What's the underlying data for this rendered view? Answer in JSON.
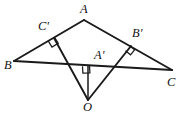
{
  "figure": {
    "type": "geometry-diagram",
    "width": 183,
    "height": 117,
    "background_color": "#ffffff",
    "stroke_color": "#1a1a1a",
    "labels": {
      "A": "A",
      "B": "B",
      "C": "C",
      "O": "O",
      "A_prime": "A'",
      "B_prime": "B'",
      "C_prime": "C'"
    },
    "points": [
      {
        "name": "A",
        "label": "A",
        "x": 84,
        "y": 20,
        "label_x": 80,
        "label_y": 3
      },
      {
        "name": "B",
        "label": "B",
        "x": 14,
        "y": 61,
        "label_x": 5,
        "label_y": 60
      },
      {
        "name": "C",
        "label": "C",
        "x": 172,
        "y": 70,
        "label_x": 167,
        "label_y": 76
      },
      {
        "name": "O",
        "label": "O",
        "x": 88,
        "y": 100,
        "label_x": 83,
        "label_y": 101
      },
      {
        "name": "A'",
        "label": "A'",
        "x": 88,
        "y": 66,
        "label_x": 94,
        "label_y": 49
      },
      {
        "name": "B'",
        "label": "B'",
        "x": 131,
        "y": 46,
        "label_x": 132,
        "label_y": 27
      },
      {
        "name": "C'",
        "label": "C'",
        "x": 54,
        "y": 38,
        "label_x": 39,
        "label_y": 20
      }
    ],
    "segments": [
      {
        "name": "AB",
        "from": "A",
        "to": "B",
        "style": "main"
      },
      {
        "name": "AC",
        "from": "A",
        "to": "C",
        "style": "main"
      },
      {
        "name": "BC",
        "from": "B",
        "to": "C",
        "style": "main"
      },
      {
        "name": "OA'",
        "from": "O",
        "to": "A'",
        "style": "thin"
      },
      {
        "name": "OB'",
        "from": "O",
        "to": "B'",
        "style": "main"
      },
      {
        "name": "OC'",
        "from": "O",
        "to": "C'",
        "style": "main"
      }
    ],
    "right_angles": [
      {
        "name": "right-angle-at-C-prime",
        "at": "C'",
        "size": 7
      },
      {
        "name": "right-angle-at-B-prime",
        "at": "B'",
        "size": 7
      },
      {
        "name": "right-angle-at-A-prime",
        "at": "A'",
        "size": 7
      }
    ]
  }
}
